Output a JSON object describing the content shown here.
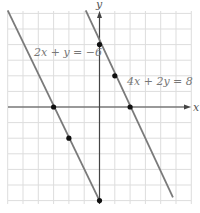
{
  "chart_data": {
    "type": "line",
    "title": "",
    "xlabel": "x",
    "ylabel": "y",
    "xlim": [
      -6,
      6
    ],
    "ylim": [
      -6.2,
      6.2
    ],
    "grid": true,
    "grid_step": 1,
    "tick_labels_shown": false,
    "series": [
      {
        "name": "2x + y = −6",
        "equation": "2x + y = -6",
        "slope": -2,
        "intercept": -6,
        "line_segment": [
          [
            -6,
            6.2
          ],
          [
            0,
            -6
          ]
        ],
        "marked_points": [
          [
            -3,
            0
          ],
          [
            -2,
            -2
          ],
          [
            0,
            -6
          ]
        ],
        "label_position": [
          -4.2,
          3.6
        ]
      },
      {
        "name": "4x + 2y = 8",
        "equation": "4x + 2y = 8",
        "slope": -2,
        "intercept": 4,
        "line_segment": [
          [
            -0.9,
            6.2
          ],
          [
            4.8,
            -5.8
          ]
        ],
        "marked_points": [
          [
            0,
            4
          ],
          [
            1,
            2
          ],
          [
            2,
            0
          ]
        ],
        "label_position": [
          1.8,
          1.7
        ]
      }
    ]
  },
  "labels": {
    "x_axis": "x",
    "y_axis": "y",
    "line1": "2x + y = −6",
    "line2": "4x + 2y = 8"
  },
  "colors": {
    "grid": "#dddddd",
    "axes": "#444444",
    "lines": "#7a7a7a",
    "points": "#111111",
    "label_text": "#777777"
  }
}
